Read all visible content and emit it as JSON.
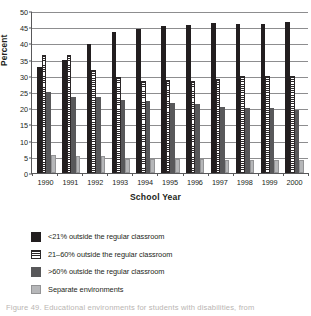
{
  "chart_data": {
    "type": "bar",
    "title": "",
    "xlabel": "School Year",
    "ylabel": "Percent",
    "ylim": [
      0,
      50
    ],
    "yticks": [
      0,
      5,
      10,
      15,
      20,
      25,
      30,
      35,
      40,
      45,
      50
    ],
    "grid": true,
    "legend_position": "below",
    "categories": [
      "1990",
      "1991",
      "1992",
      "1993",
      "1994",
      "1995",
      "1996",
      "1997",
      "1998",
      "1999",
      "2000"
    ],
    "series": [
      {
        "name": "<21% outside the regular classroom",
        "swatch": "solid-black",
        "color": "#221e1f",
        "values": [
          32.8,
          34.9,
          39.8,
          43.4,
          44.5,
          45.4,
          45.7,
          46.4,
          46.1,
          45.9,
          46.5
        ]
      },
      {
        "name": "21–60% outside the regular classroom",
        "swatch": "horizontal-stripes",
        "color": "#ffffff",
        "values": [
          36.4,
          36.3,
          31.7,
          29.5,
          28.5,
          28.7,
          28.5,
          29.0,
          29.8,
          29.8,
          29.8
        ]
      },
      {
        "name": ">60% outside the regular classroom",
        "swatch": "solid-dark-gray",
        "color": "#58585a",
        "values": [
          25.1,
          23.5,
          23.4,
          22.6,
          22.3,
          21.5,
          21.2,
          20.3,
          20.0,
          20.2,
          19.4
        ]
      },
      {
        "name": "Separate environments",
        "swatch": "solid-light-gray",
        "color": "#b6b7b9",
        "values": [
          5.6,
          5.2,
          5.1,
          4.4,
          4.2,
          4.4,
          4.2,
          3.9,
          3.9,
          3.9,
          4.1
        ]
      }
    ]
  },
  "axes": {
    "y_title": "Percent",
    "x_title": "School Year"
  },
  "caption": {
    "text": "Figure 49. Educational environments for students with disabilities, from"
  }
}
